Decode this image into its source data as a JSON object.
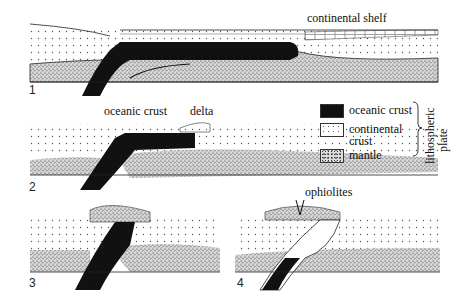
{
  "diagram": {
    "panels": [
      {
        "number": "1",
        "labels": [
          "continental shelf"
        ]
      },
      {
        "number": "2",
        "labels": [
          "oceanic crust",
          "delta"
        ]
      },
      {
        "number": "3",
        "labels": []
      },
      {
        "number": "4",
        "labels": [
          "ophiolites"
        ]
      }
    ],
    "legend": {
      "items": [
        {
          "label": "oceanic crust",
          "pattern": "solid-black"
        },
        {
          "label_line1": "continental",
          "label_line2": "crust",
          "pattern": "dotted"
        },
        {
          "label": "mantle",
          "pattern": "stippled"
        }
      ],
      "group_label_line1": "lithospheric",
      "group_label_line2": "plate"
    },
    "colors": {
      "ink": "#111111",
      "background": "#ffffff",
      "mantle_fill": "#d8d8d8"
    }
  }
}
